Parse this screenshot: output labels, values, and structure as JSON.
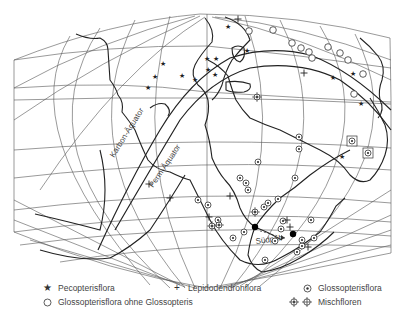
{
  "map": {
    "labels": {
      "karbon_equator": "Karbon-Äquator",
      "perm_equator": "Perm-Äquator",
      "south_pole": "Südpol"
    },
    "markers": {
      "pecopteris": [
        [
          163,
          63
        ],
        [
          155,
          76
        ],
        [
          148,
          87
        ],
        [
          182,
          75
        ],
        [
          195,
          79
        ],
        [
          208,
          69
        ],
        [
          215,
          74
        ],
        [
          207,
          58
        ],
        [
          216,
          58
        ],
        [
          228,
          26
        ],
        [
          247,
          50
        ],
        [
          333,
          77
        ],
        [
          353,
          73
        ],
        [
          361,
          103
        ],
        [
          342,
          156
        ]
      ],
      "glossopteris": [
        [
          299,
          137
        ],
        [
          299,
          149
        ],
        [
          295,
          178
        ],
        [
          258,
          162
        ],
        [
          240,
          178
        ],
        [
          264,
          207
        ],
        [
          268,
          203
        ],
        [
          283,
          221
        ],
        [
          281,
          229
        ],
        [
          248,
          190
        ],
        [
          246,
          183
        ],
        [
          278,
          199
        ],
        [
          275,
          241
        ],
        [
          244,
          232
        ],
        [
          265,
          260
        ],
        [
          297,
          252
        ],
        [
          302,
          246
        ],
        [
          311,
          220
        ],
        [
          314,
          238
        ],
        [
          302,
          240
        ],
        [
          208,
          205
        ],
        [
          198,
          200
        ],
        [
          233,
          238
        ],
        [
          218,
          220
        ]
      ],
      "glossopteris_boxed": [
        [
          352,
          141
        ],
        [
          368,
          153
        ]
      ],
      "glossopteris_no_glossopteris": [
        [
          249,
          31
        ],
        [
          273,
          30
        ],
        [
          292,
          43
        ],
        [
          301,
          48
        ],
        [
          309,
          52
        ],
        [
          312,
          58
        ],
        [
          328,
          47
        ],
        [
          340,
          53
        ],
        [
          348,
          60
        ],
        [
          363,
          74
        ],
        [
          354,
          94
        ]
      ],
      "lepidodendron": [
        [
          238,
          19
        ],
        [
          304,
          73
        ],
        [
          149,
          184
        ],
        [
          230,
          196
        ],
        [
          209,
          217
        ],
        [
          287,
          220
        ],
        [
          290,
          227
        ],
        [
          308,
          247
        ],
        [
          170,
          198
        ]
      ],
      "mixed": [
        [
          255,
          212
        ],
        [
          212,
          226
        ],
        [
          219,
          225
        ],
        [
          257,
          97
        ]
      ],
      "poles": [
        [
          255,
          227
        ],
        [
          293,
          234
        ]
      ]
    }
  },
  "legend": {
    "items": [
      {
        "symbol": "star",
        "label": "Pecopterisflora"
      },
      {
        "symbol": "plus",
        "label": "Lepidodendronflora"
      },
      {
        "symbol": "dot-circle",
        "label": "Glossopterisflora"
      },
      {
        "symbol": "circle",
        "label": "Glossopterisflora ohne Glossopteris"
      },
      {
        "symbol": "mixed",
        "label": "Mischfloren"
      }
    ]
  }
}
